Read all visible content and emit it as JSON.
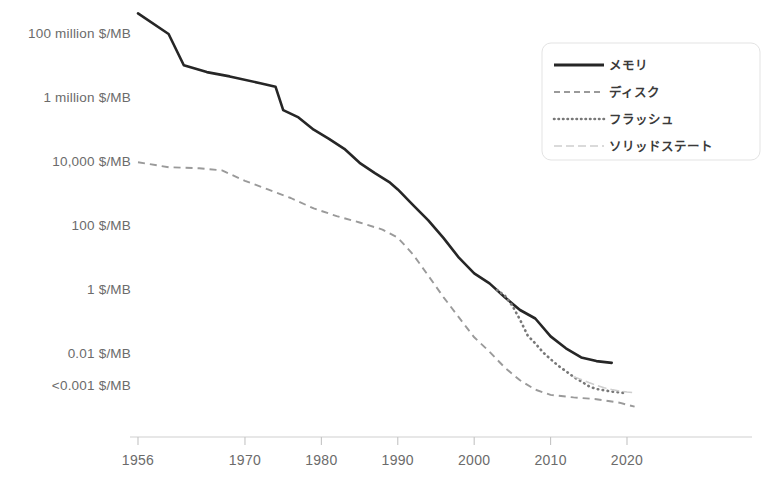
{
  "chart_data": {
    "type": "line",
    "title": "",
    "subtitle": "",
    "xlabel": "",
    "ylabel": "",
    "y_scale": "log",
    "y_unit": "$/MB",
    "grid": false,
    "legend_position": "top-right",
    "xlim": [
      1956,
      2022
    ],
    "ylim": [
      0.0005,
      100000000
    ],
    "x_ticks": [
      1956,
      1970,
      1980,
      1990,
      2000,
      2010,
      2020
    ],
    "x_tick_labels": [
      "1956",
      "1970",
      "1980",
      "1990",
      "2000",
      "2010",
      "2020"
    ],
    "y_ticks": [
      100000000,
      1000000,
      10000,
      100,
      1,
      0.01,
      0.001
    ],
    "y_tick_labels": [
      "100 million $/MB",
      "1 million $/MB",
      "10,000 $/MB",
      "100 $/MB",
      "1 $/MB",
      "0.01 $/MB",
      "<0.001 $/MB"
    ],
    "series": [
      {
        "name": "メモリ",
        "style": "solid",
        "color": "#262626",
        "points": [
          [
            1956,
            411000000
          ],
          [
            1960,
            93000000
          ],
          [
            1962,
            9800000
          ],
          [
            1965,
            6000000
          ],
          [
            1968,
            4400000
          ],
          [
            1972,
            2700000
          ],
          [
            1974,
            2100000
          ],
          [
            1975,
            390000
          ],
          [
            1977,
            230000
          ],
          [
            1979,
            95000
          ],
          [
            1981,
            49000
          ],
          [
            1983,
            24000
          ],
          [
            1985,
            8800
          ],
          [
            1987,
            4200
          ],
          [
            1989,
            2100
          ],
          [
            1990,
            1300
          ],
          [
            1992,
            420
          ],
          [
            1994,
            140
          ],
          [
            1996,
            39
          ],
          [
            1998,
            9.5
          ],
          [
            2000,
            3.1
          ],
          [
            2002,
            1.5
          ],
          [
            2004,
            0.55
          ],
          [
            2006,
            0.22
          ],
          [
            2008,
            0.12
          ],
          [
            2010,
            0.033
          ],
          [
            2012,
            0.014
          ],
          [
            2014,
            0.0073
          ],
          [
            2016,
            0.0056
          ],
          [
            2018,
            0.0049
          ]
        ]
      },
      {
        "name": "ディスク",
        "style": "dashed",
        "color": "#9a9a9a",
        "points": [
          [
            1956,
            9200
          ],
          [
            1960,
            6400
          ],
          [
            1964,
            5900
          ],
          [
            1967,
            5100
          ],
          [
            1970,
            2400
          ],
          [
            1973,
            1300
          ],
          [
            1976,
            700
          ],
          [
            1979,
            330
          ],
          [
            1982,
            190
          ],
          [
            1985,
            120
          ],
          [
            1988,
            72
          ],
          [
            1990,
            40
          ],
          [
            1992,
            12
          ],
          [
            1994,
            2.6
          ],
          [
            1996,
            0.55
          ],
          [
            1998,
            0.13
          ],
          [
            2000,
            0.031
          ],
          [
            2002,
            0.011
          ],
          [
            2004,
            0.0035
          ],
          [
            2006,
            0.0014
          ],
          [
            2008,
            0.00072
          ],
          [
            2010,
            0.00049
          ],
          [
            2013,
            0.00041
          ],
          [
            2016,
            0.00036
          ],
          [
            2019,
            0.00028
          ],
          [
            2021,
            0.00021
          ]
        ]
      },
      {
        "name": "フラッシュ",
        "style": "dotted",
        "color": "#787878",
        "points": [
          [
            2003,
            0.93
          ],
          [
            2004,
            0.62
          ],
          [
            2005,
            0.3
          ],
          [
            2006,
            0.11
          ],
          [
            2007,
            0.035
          ],
          [
            2008,
            0.02
          ],
          [
            2009,
            0.0105
          ],
          [
            2010,
            0.0064
          ],
          [
            2011,
            0.004
          ],
          [
            2012,
            0.0027
          ],
          [
            2013,
            0.0018
          ],
          [
            2014,
            0.0013
          ],
          [
            2015,
            0.00092
          ],
          [
            2016,
            0.00075
          ],
          [
            2018,
            0.00062
          ],
          [
            2020,
            0.00055
          ]
        ]
      },
      {
        "name": "ソリッドステート",
        "style": "dashdot",
        "color": "#cecece",
        "points": [
          [
            2013,
            0.0018
          ],
          [
            2014,
            0.0015
          ],
          [
            2015,
            0.0012
          ],
          [
            2016,
            0.00098
          ],
          [
            2017,
            0.00082
          ],
          [
            2018,
            0.00072
          ],
          [
            2019,
            0.00065
          ],
          [
            2020,
            0.0006
          ],
          [
            2021,
            0.00057
          ]
        ]
      }
    ],
    "legend": [
      {
        "label": "メモリ",
        "style": "solid"
      },
      {
        "label": "ディスク",
        "style": "dashed"
      },
      {
        "label": "フラッシュ",
        "style": "dotted"
      },
      {
        "label": "ソリッドステート",
        "style": "dashdot"
      }
    ]
  }
}
